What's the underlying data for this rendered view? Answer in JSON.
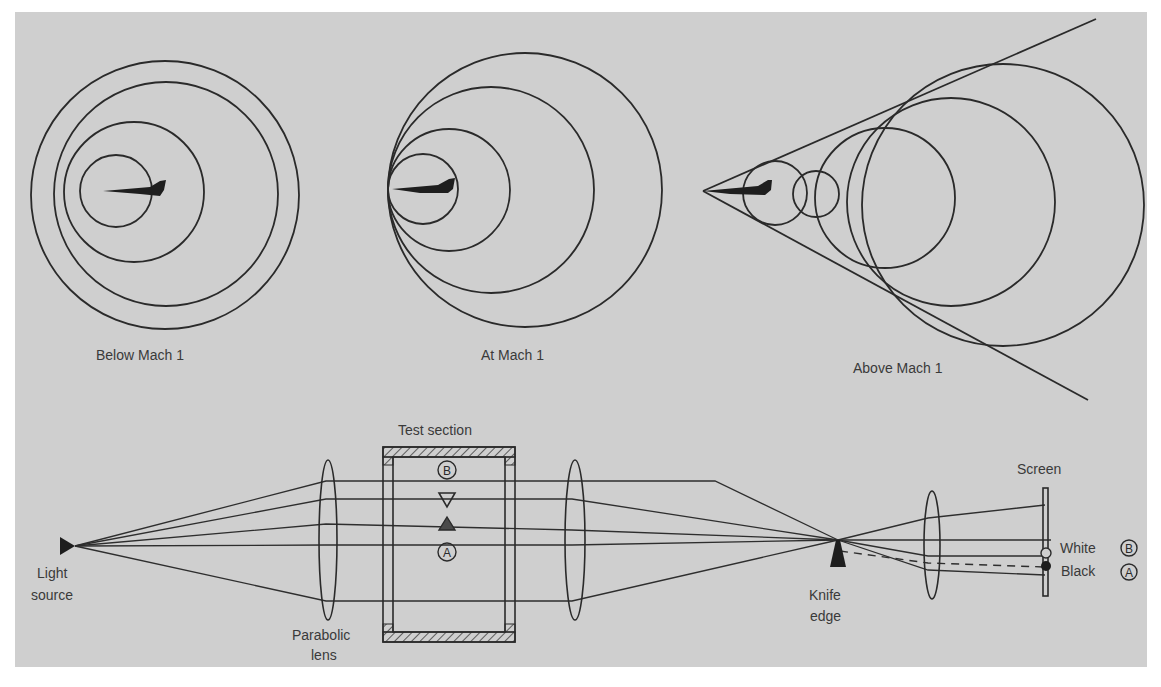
{
  "figure": {
    "background_color": "#cfcfcf",
    "line_color": "#2a2a2a",
    "panels": {
      "below_mach": {
        "caption": "Below Mach 1"
      },
      "at_mach": {
        "caption": "At Mach 1"
      },
      "above_mach": {
        "caption": "Above Mach 1"
      }
    },
    "schlieren": {
      "light_source_line1": "Light",
      "light_source_line2": "source",
      "parabolic_lens_line1": "Parabolic",
      "parabolic_lens_line2": "lens",
      "test_section": "Test section",
      "knife_edge_line1": "Knife",
      "knife_edge_line2": "edge",
      "screen": "Screen",
      "white": "White",
      "black": "Black",
      "marker_b": "B",
      "marker_a": "A"
    }
  }
}
